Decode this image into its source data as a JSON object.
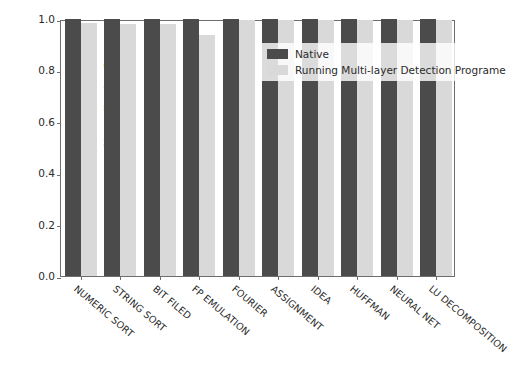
{
  "chart_data": {
    "type": "bar",
    "title": "",
    "xlabel": "",
    "ylabel": "Normalization Score",
    "ylim": [
      0.0,
      1.0
    ],
    "yticks": [
      "0.0",
      "0.2",
      "0.4",
      "0.6",
      "0.8",
      "1.0"
    ],
    "ytick_values": [
      0.0,
      0.2,
      0.4,
      0.6,
      0.8,
      1.0
    ],
    "grid": false,
    "legend_position": "upper right",
    "categories": [
      "NUMERIC SORT",
      "STRING SORT",
      "BIT FILED",
      "FP EMULATION",
      "FOURIER",
      "ASSIGNMENT",
      "IDEA",
      "HUFFMAN",
      "NEURAL NET",
      "LU DECOMPOSITION"
    ],
    "series": [
      {
        "name": "Native",
        "color": "#4b4b4b",
        "values": [
          1.0,
          1.0,
          1.0,
          1.0,
          1.0,
          1.0,
          1.0,
          1.0,
          1.0,
          1.0
        ]
      },
      {
        "name": "Running Multi-layer Detection Programe",
        "color": "#d9d9d9",
        "values": [
          0.986,
          0.981,
          0.981,
          0.937,
          0.997,
          0.997,
          0.998,
          0.998,
          0.997,
          0.997
        ]
      }
    ]
  },
  "legend": {
    "entries": [
      {
        "label": "Native",
        "swatch": "native"
      },
      {
        "label": "Running Multi-layer Detection Programe",
        "swatch": "detector"
      }
    ]
  },
  "axis": {
    "y_label": "Normalization Score"
  }
}
